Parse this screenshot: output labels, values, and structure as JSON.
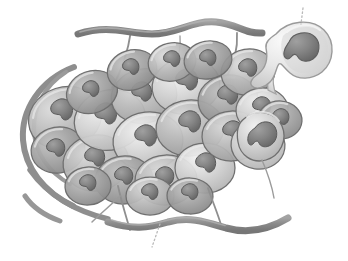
{
  "figure": {
    "title": "Tumor cell cluster with escaping metastatic cell",
    "background_color": "#ffffff",
    "width": 348,
    "height": 261,
    "style": "grayscale-airbrush-biomedical-illustration",
    "visible_text": []
  },
  "palette": {
    "background": "#ffffff",
    "cell_fill_light": "#cfcfcf",
    "cell_fill_mid": "#b4b4b4",
    "cell_fill_dark": "#9d9d9d",
    "cell_highlight": "#eaeaea",
    "cell_outline": "#6f6f6f",
    "nucleus_fill": "#858585",
    "nucleus_fill_dark": "#6e6e6e",
    "nucleus_outline": "#5a5a5a",
    "fiber_band": "#8e8e8e",
    "fiber_band_dark": "#7a7a7a",
    "tendril": "#8a8a8a",
    "leader_line": "#b9b9b9",
    "escaping_cell_fill": "#e2e2e2",
    "escaping_cell_outline": "#9a9a9a"
  },
  "elements": {
    "cell_mass": {
      "label": "tumor-cell-mass",
      "description": "Dense irregular cluster of rounded epithelial tumor cells, each with a lobed nucleus",
      "cell_count": 24,
      "center": [
        175,
        135
      ],
      "extent": [
        145,
        270
      ]
    },
    "escaping_cell": {
      "label": "escaping-metastatic-cell",
      "description": "Single pale cell budding off the upper-right of the mass via a narrow cytoplasmic neck",
      "position": [
        296,
        50
      ],
      "radius": 33,
      "nucleus_position": [
        296,
        44
      ],
      "nucleus_radius": 15
    },
    "leader_lines": [
      {
        "name": "leader-line-top",
        "points": [
          [
            303,
            8
          ],
          [
            301,
            24
          ]
        ],
        "style": "dotted",
        "target": "escaping-metastatic-cell"
      },
      {
        "name": "leader-line-bottom",
        "points": [
          [
            160,
            224
          ],
          [
            152,
            247
          ]
        ],
        "style": "dotted",
        "target": "extracellular-matrix-fiber"
      }
    ],
    "fibers": [
      {
        "name": "ecm-fiber-top",
        "description": "Thick wavy band crossing above the cell mass",
        "thickness": 7
      },
      {
        "name": "ecm-fiber-bottom",
        "description": "Thick wavy band crossing below the cell mass",
        "thickness": 7
      },
      {
        "name": "ecm-arc-left-outer",
        "description": "Long curved arc wrapping the left flank of the mass",
        "thickness": 6
      },
      {
        "name": "ecm-arc-left-inner",
        "description": "Shorter curved arc inside the outer left arc",
        "thickness": 5
      },
      {
        "name": "ecm-arc-lower-left",
        "description": "Short arc fragment at lower left",
        "thickness": 5
      }
    ],
    "tendrils": [
      {
        "name": "tendril-upper-left",
        "description": "Thin fiber from top band down into the mass"
      },
      {
        "name": "tendril-upper-right",
        "description": "Thin fiber from top band down into the mass"
      },
      {
        "name": "tendril-lower-left",
        "description": "Thin fiber from mass down to bottom band"
      },
      {
        "name": "tendril-lower-right",
        "description": "Thin fiber from mass down to bottom band"
      },
      {
        "name": "tendril-right",
        "description": "Thin fiber trailing from the escaping cell region"
      }
    ]
  },
  "cells": [
    {
      "id": 1,
      "cx": 65,
      "cy": 118,
      "rx": 37,
      "ry": 31,
      "rot": -18,
      "tone": "mid",
      "nx": 62,
      "ny": 110,
      "nr": 12
    },
    {
      "id": 2,
      "cx": 58,
      "cy": 150,
      "rx": 27,
      "ry": 23,
      "rot": -10,
      "tone": "dark",
      "nx": 56,
      "ny": 148,
      "nr": 10
    },
    {
      "id": 3,
      "cx": 96,
      "cy": 163,
      "rx": 33,
      "ry": 28,
      "rot": -8,
      "tone": "mid",
      "nx": 95,
      "ny": 157,
      "nr": 11
    },
    {
      "id": 4,
      "cx": 110,
      "cy": 120,
      "rx": 36,
      "ry": 30,
      "rot": -14,
      "tone": "light",
      "nx": 106,
      "ny": 114,
      "nr": 12
    },
    {
      "id": 5,
      "cx": 144,
      "cy": 96,
      "rx": 33,
      "ry": 27,
      "rot": -12,
      "tone": "mid",
      "nx": 142,
      "ny": 92,
      "nr": 11
    },
    {
      "id": 6,
      "cx": 148,
      "cy": 141,
      "rx": 35,
      "ry": 29,
      "rot": -6,
      "tone": "light",
      "nx": 146,
      "ny": 136,
      "nr": 12
    },
    {
      "id": 7,
      "cx": 124,
      "cy": 180,
      "rx": 29,
      "ry": 24,
      "rot": -4,
      "tone": "dark",
      "nx": 124,
      "ny": 176,
      "nr": 10
    },
    {
      "id": 8,
      "cx": 166,
      "cy": 180,
      "rx": 31,
      "ry": 25,
      "rot": -2,
      "tone": "mid",
      "nx": 165,
      "ny": 176,
      "nr": 10
    },
    {
      "id": 9,
      "cx": 186,
      "cy": 86,
      "rx": 34,
      "ry": 28,
      "rot": -8,
      "tone": "light",
      "nx": 187,
      "ny": 80,
      "nr": 12
    },
    {
      "id": 10,
      "cx": 190,
      "cy": 128,
      "rx": 34,
      "ry": 28,
      "rot": -4,
      "tone": "mid",
      "nx": 190,
      "ny": 122,
      "nr": 12
    },
    {
      "id": 11,
      "cx": 205,
      "cy": 168,
      "rx": 30,
      "ry": 25,
      "rot": 0,
      "tone": "light",
      "nx": 206,
      "ny": 163,
      "nr": 11
    },
    {
      "id": 12,
      "cx": 228,
      "cy": 100,
      "rx": 30,
      "ry": 25,
      "rot": -6,
      "tone": "dark",
      "nx": 228,
      "ny": 95,
      "nr": 11
    },
    {
      "id": 13,
      "cx": 232,
      "cy": 136,
      "rx": 30,
      "ry": 25,
      "rot": -2,
      "tone": "mid",
      "nx": 233,
      "ny": 131,
      "nr": 11
    },
    {
      "id": 14,
      "cx": 248,
      "cy": 72,
      "rx": 27,
      "ry": 23,
      "rot": -10,
      "tone": "mid",
      "nx": 248,
      "ny": 68,
      "nr": 10
    },
    {
      "id": 15,
      "cx": 262,
      "cy": 110,
      "rx": 26,
      "ry": 22,
      "rot": -4,
      "tone": "light",
      "nx": 262,
      "ny": 106,
      "nr": 10
    },
    {
      "id": 16,
      "cx": 258,
      "cy": 145,
      "rx": 27,
      "ry": 24,
      "rot": 8,
      "tone": "light",
      "nx": 259,
      "ny": 140,
      "nr": 11
    },
    {
      "id": 17,
      "cx": 280,
      "cy": 120,
      "rx": 22,
      "ry": 19,
      "rot": 4,
      "tone": "dark",
      "nx": 281,
      "ny": 117,
      "nr": 9
    },
    {
      "id": 18,
      "cx": 92,
      "cy": 92,
      "rx": 26,
      "ry": 21,
      "rot": -20,
      "tone": "dark",
      "nx": 91,
      "ny": 89,
      "nr": 9
    },
    {
      "id": 19,
      "cx": 132,
      "cy": 70,
      "rx": 25,
      "ry": 20,
      "rot": -16,
      "tone": "dark",
      "nx": 131,
      "ny": 67,
      "nr": 9
    },
    {
      "id": 20,
      "cx": 172,
      "cy": 62,
      "rx": 24,
      "ry": 19,
      "rot": -12,
      "tone": "mid",
      "nx": 172,
      "ny": 59,
      "nr": 9
    },
    {
      "id": 21,
      "cx": 208,
      "cy": 60,
      "rx": 24,
      "ry": 19,
      "rot": -10,
      "tone": "dark",
      "nx": 208,
      "ny": 58,
      "nr": 9
    },
    {
      "id": 22,
      "cx": 88,
      "cy": 186,
      "rx": 23,
      "ry": 19,
      "rot": -4,
      "tone": "dark",
      "nx": 88,
      "ny": 183,
      "nr": 9
    },
    {
      "id": 23,
      "cx": 150,
      "cy": 196,
      "rx": 24,
      "ry": 19,
      "rot": 0,
      "tone": "mid",
      "nx": 150,
      "ny": 192,
      "nr": 9
    },
    {
      "id": 24,
      "cx": 190,
      "cy": 196,
      "rx": 23,
      "ry": 18,
      "rot": 2,
      "tone": "dark",
      "nx": 190,
      "ny": 192,
      "nr": 9
    }
  ]
}
